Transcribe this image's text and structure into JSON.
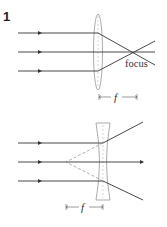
{
  "figure": {
    "number": "1",
    "convex": {
      "label_focus": "focus",
      "label_f": "f"
    },
    "concave": {
      "label_f": "f"
    }
  },
  "colors": {
    "ray": "#333333",
    "lens": "#888888"
  }
}
